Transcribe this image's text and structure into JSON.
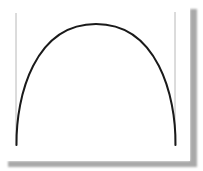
{
  "figure": {
    "background_color": "#ffffff",
    "curve": {
      "shape": "arch",
      "color": "#1a1a1a",
      "stroke_width": 2,
      "start": [
        16,
        145
      ],
      "apex": [
        96,
        24
      ],
      "end": [
        176,
        145
      ]
    },
    "left_line": {
      "color": "#b8b8b8",
      "x": 16,
      "y1": 13,
      "y2": 146
    },
    "right_line": {
      "color": "#b8b8b8",
      "x": 175,
      "y1": 12,
      "y2": 146
    },
    "shadow": {
      "color": "#a8a8a8"
    }
  }
}
